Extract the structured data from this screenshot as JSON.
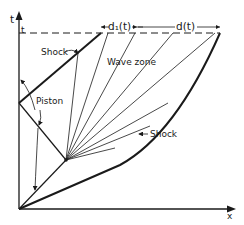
{
  "figure": {
    "axes": {
      "x_label": "x",
      "y_label": "t",
      "t_marker": "t"
    },
    "labels": {
      "shock_upper": "Shock",
      "shock_lower": "Shock",
      "piston": "Piston",
      "wave_zone": "Wave zone",
      "d1": "d₁(t)",
      "d": "d(t)"
    },
    "colors": {
      "ink": "#1a1a1a",
      "background": "#ffffff"
    },
    "caption_partial": "Fig. ..."
  }
}
